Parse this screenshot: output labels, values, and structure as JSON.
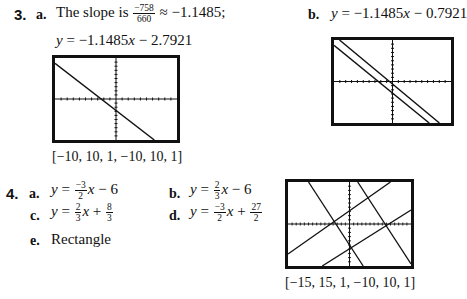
{
  "problem3": {
    "number": "3.",
    "a": {
      "label": "a.",
      "text_before": "The slope is",
      "fraction": {
        "numerator": "−758",
        "denominator": "660"
      },
      "text_after": "≈ −1.1485;",
      "equation": {
        "lhs": "y",
        "rhs": " = −1.1485",
        "var": "x",
        "tail": " − 2.7921"
      },
      "window": "[−10, 10, 1, −10, 10, 1]"
    },
    "b": {
      "label": "b.",
      "equation": {
        "lhs": "y",
        "rhs": " = −1.1485",
        "var": "x",
        "tail": " − 0.7921"
      }
    }
  },
  "problem4": {
    "number": "4.",
    "a": {
      "label": "a.",
      "lhs": "y",
      "eq": " = ",
      "frac": {
        "numerator": "−3",
        "denominator": "2"
      },
      "var": "x",
      "tail": " − 6"
    },
    "b": {
      "label": "b.",
      "lhs": "y",
      "eq": " = ",
      "frac": {
        "numerator": "2",
        "denominator": "3"
      },
      "var": "x",
      "tail": " − 6"
    },
    "c": {
      "label": "c.",
      "lhs": "y",
      "eq": " = ",
      "frac": {
        "numerator": "2",
        "denominator": "3"
      },
      "var": "x",
      "plus": " + ",
      "const_frac": {
        "numerator": "8",
        "denominator": "3"
      }
    },
    "d": {
      "label": "d.",
      "lhs": "y",
      "eq": " = ",
      "frac": {
        "numerator": "−3",
        "denominator": "2"
      },
      "var": "x",
      "plus": " + ",
      "const_frac": {
        "numerator": "27",
        "denominator": "2"
      }
    },
    "e": {
      "label": "e.",
      "text": "Rectangle"
    },
    "window": "[−15, 15, 1, −10, 10, 1]"
  },
  "graphs": [
    {
      "id": "3a",
      "xmin": -10,
      "xmax": 10,
      "ymin": -10,
      "ymax": 10,
      "lines": [
        {
          "m": -1.1485,
          "b": -2.7921
        }
      ]
    },
    {
      "id": "3b",
      "xmin": -10,
      "xmax": 10,
      "ymin": -10,
      "ymax": 10,
      "lines": [
        {
          "m": -1.1485,
          "b": -2.7921
        },
        {
          "m": -1.1485,
          "b": -0.7921
        }
      ]
    },
    {
      "id": "4",
      "xmin": -15,
      "xmax": 15,
      "ymin": -10,
      "ymax": 10,
      "lines": [
        {
          "m": -1.5,
          "b": -6
        },
        {
          "m": 0.6667,
          "b": -6
        },
        {
          "m": 0.6667,
          "b": 2.6667
        },
        {
          "m": -1.5,
          "b": 13.5
        }
      ]
    }
  ]
}
